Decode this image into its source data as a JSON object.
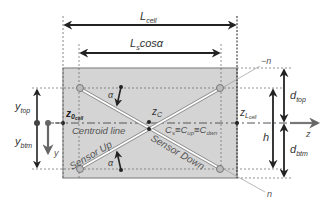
{
  "diagram": {
    "type": "cross-section schematic",
    "colors": {
      "cell_fill": "#d4d4d4",
      "cell_border": "#8a8a8a",
      "arrow": "#222222",
      "gray_arrow": "#666666",
      "sensor": "#ffffff"
    },
    "labels": {
      "l_cell": "L",
      "l_cell_sub": "cell",
      "ls_cos": "L",
      "ls_cos_sub": "s",
      "ls_cos_tail": "cosα",
      "neg_n": "−n",
      "n": "n",
      "alpha_top": "α",
      "alpha_bottom": "α",
      "z0": "z",
      "z0_sub": "0",
      "z0_subsub": "cell",
      "zc": "z",
      "zc_sub": "C",
      "zl": "z",
      "zl_sub": "L",
      "zl_subsub": "cell",
      "centroid_line": "Centroid line",
      "cs_eq": "C",
      "cs_sub": "s",
      "cup": "≡C",
      "cup_sub": "up",
      "cdwn": "≡C",
      "cdwn_sub": "dwn",
      "sensor_up": "Sensor Up",
      "sensor_down": "Sensor Down",
      "y_top": "y",
      "y_top_sub": "top",
      "y_btm": "y",
      "y_btm_sub": "btm",
      "y": "y",
      "d_top": "d",
      "d_top_sub": "top",
      "d_btm": "d",
      "d_btm_sub": "btm",
      "h": "h",
      "z_axis": "z"
    }
  }
}
